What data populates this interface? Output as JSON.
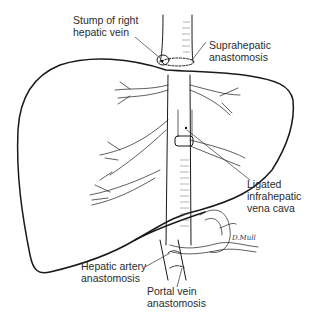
{
  "figure": {
    "labels": {
      "stump_right_hepatic_vein": "Stump of right\nhepatic vein",
      "suprahepatic_anastomosis": "Suprahepatic\nanastomosis",
      "ligated_infrahepatic_vena_cava": "Ligated\ninfrahepatic\nvena cava",
      "hepatic_artery_anastomosis": "Hepatic artery\nanastomosis",
      "portal_vein_anastomosis": "Portal vein\nanastomosis"
    },
    "signature": "D.Mull"
  }
}
